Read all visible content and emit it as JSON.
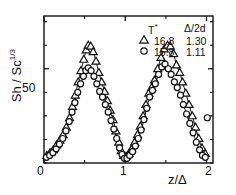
{
  "chart_data": {
    "type": "scatter",
    "title": "",
    "xlabel": "z/Δ",
    "ylabel": "Sh / Sc^1/3",
    "ylabel_base": "Sh / Sc",
    "ylabel_exp": "1/3",
    "xlim": [
      0,
      2.08
    ],
    "ylim": [
      0,
      78
    ],
    "xticks": [
      0,
      1,
      2
    ],
    "xticklabels": [
      "0",
      "1",
      "2"
    ],
    "yticks": [
      0,
      25,
      50,
      75
    ],
    "yticklabels": [
      "",
      "",
      "50",
      ""
    ],
    "grid": false,
    "legend_position": "top-right",
    "legend_headers": [
      "T*",
      "Δ/2d"
    ],
    "legend_header_t": "T",
    "legend_header_t_sup": "*",
    "legend_header_d": "Δ/2d",
    "series": [
      {
        "name": "T* = 16.8",
        "marker": "open-triangle",
        "t_star": "16.8",
        "delta_2d": "1.30",
        "points": [
          [
            0.035,
            4.0
          ],
          [
            0.075,
            5.5
          ],
          [
            0.115,
            7.0
          ],
          [
            0.155,
            9.5
          ],
          [
            0.195,
            12.0
          ],
          [
            0.235,
            15.0
          ],
          [
            0.275,
            19.0
          ],
          [
            0.315,
            24.0
          ],
          [
            0.35,
            30.0
          ],
          [
            0.385,
            36.0
          ],
          [
            0.42,
            43.0
          ],
          [
            0.455,
            49.0
          ],
          [
            0.49,
            55.0
          ],
          [
            0.52,
            60.0
          ],
          [
            0.545,
            62.5
          ],
          [
            0.575,
            62.0
          ],
          [
            0.605,
            59.0
          ],
          [
            0.64,
            54.0
          ],
          [
            0.675,
            48.0
          ],
          [
            0.71,
            43.0
          ],
          [
            0.745,
            38.0
          ],
          [
            0.78,
            33.0
          ],
          [
            0.815,
            28.0
          ],
          [
            0.85,
            23.0
          ],
          [
            0.885,
            17.0
          ],
          [
            0.92,
            11.0
          ],
          [
            0.95,
            6.5
          ],
          [
            0.98,
            4.0
          ],
          [
            1.01,
            3.5
          ],
          [
            1.045,
            5.0
          ],
          [
            1.08,
            7.5
          ],
          [
            1.115,
            11.0
          ],
          [
            1.15,
            15.0
          ],
          [
            1.185,
            19.5
          ],
          [
            1.22,
            25.0
          ],
          [
            1.255,
            31.0
          ],
          [
            1.29,
            37.0
          ],
          [
            1.325,
            40.0
          ],
          [
            1.36,
            44.0
          ],
          [
            1.4,
            50.0
          ],
          [
            1.44,
            56.0
          ],
          [
            1.48,
            60.5
          ],
          [
            1.52,
            62.5
          ],
          [
            1.555,
            62.0
          ],
          [
            1.595,
            58.0
          ],
          [
            1.63,
            52.0
          ],
          [
            1.67,
            48.0
          ],
          [
            1.705,
            43.0
          ],
          [
            1.745,
            37.0
          ],
          [
            1.785,
            31.0
          ],
          [
            1.825,
            25.0
          ],
          [
            1.865,
            19.0
          ],
          [
            1.905,
            13.0
          ],
          [
            1.945,
            8.0
          ],
          [
            1.985,
            5.0
          ]
        ]
      },
      {
        "name": "T* = 15.8",
        "marker": "open-circle",
        "t_star": "15.8",
        "delta_2d": "1.11",
        "points": [
          [
            0.03,
            3.0
          ],
          [
            0.07,
            4.0
          ],
          [
            0.11,
            5.5
          ],
          [
            0.15,
            7.5
          ],
          [
            0.19,
            10.0
          ],
          [
            0.23,
            13.0
          ],
          [
            0.27,
            17.0
          ],
          [
            0.31,
            22.0
          ],
          [
            0.345,
            27.0
          ],
          [
            0.38,
            32.0
          ],
          [
            0.415,
            37.5
          ],
          [
            0.45,
            42.0
          ],
          [
            0.485,
            46.0
          ],
          [
            0.515,
            49.0
          ],
          [
            0.545,
            50.5
          ],
          [
            0.58,
            49.0
          ],
          [
            0.615,
            46.0
          ],
          [
            0.65,
            42.0
          ],
          [
            0.685,
            38.0
          ],
          [
            0.72,
            35.0
          ],
          [
            0.755,
            31.0
          ],
          [
            0.79,
            27.0
          ],
          [
            0.825,
            22.5
          ],
          [
            0.86,
            18.0
          ],
          [
            0.895,
            13.0
          ],
          [
            0.93,
            8.0
          ],
          [
            0.96,
            4.5
          ],
          [
            0.99,
            2.5
          ],
          [
            1.02,
            2.5
          ],
          [
            1.055,
            4.0
          ],
          [
            1.09,
            6.0
          ],
          [
            1.125,
            9.0
          ],
          [
            1.16,
            13.0
          ],
          [
            1.195,
            17.5
          ],
          [
            1.23,
            23.0
          ],
          [
            1.265,
            29.0
          ],
          [
            1.3,
            35.0
          ],
          [
            1.335,
            38.5
          ],
          [
            1.37,
            42.0
          ],
          [
            1.41,
            47.0
          ],
          [
            1.45,
            51.0
          ],
          [
            1.49,
            52.5
          ],
          [
            1.53,
            50.0
          ],
          [
            1.565,
            47.0
          ],
          [
            1.605,
            43.0
          ],
          [
            1.64,
            40.0
          ],
          [
            1.68,
            36.0
          ],
          [
            1.715,
            31.0
          ],
          [
            1.755,
            26.0
          ],
          [
            1.795,
            21.0
          ],
          [
            1.835,
            16.0
          ],
          [
            1.875,
            11.0
          ],
          [
            1.915,
            7.0
          ],
          [
            1.95,
            4.0
          ],
          [
            1.985,
            3.0
          ],
          [
            2.01,
            24.0
          ]
        ]
      }
    ]
  }
}
